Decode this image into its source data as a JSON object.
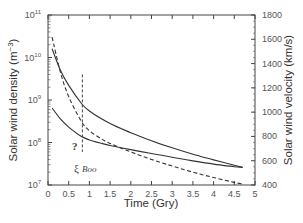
{
  "chart_data": {
    "type": "line",
    "title": "",
    "xlabel": "Time (Gry)",
    "ylabel_left": "Solar wind density (m^-3)",
    "ylabel_right": "Solar wind velocity (km/s)",
    "xlim": [
      0,
      5
    ],
    "ylim_left": [
      10000000.0,
      100000000000.0
    ],
    "ylim_left_scale": "log",
    "ylim_right": [
      400,
      1800
    ],
    "x_ticks": [
      "0",
      "0.5",
      "1",
      "1.5",
      "2",
      "2.5",
      "3",
      "3.5",
      "4",
      "4.5",
      "5"
    ],
    "y_left_ticks": [
      "10^7",
      "10^8",
      "10^9",
      "10^10",
      "10^11"
    ],
    "y_right_ticks": [
      "400",
      "600",
      "800",
      "1000",
      "1200",
      "1400",
      "1600",
      "1800"
    ],
    "grid": false,
    "legend": "none",
    "series": [
      {
        "name": "upper solid curve",
        "style": "solid",
        "axis": "left",
        "x": [
          0.1,
          0.3,
          0.5,
          0.8,
          1.0,
          1.5,
          2.0,
          2.5,
          3.0,
          3.5,
          4.0,
          4.5,
          4.7
        ],
        "values": [
          16000000000.0,
          5000000000.0,
          2200000000.0,
          850000000.0,
          550000000.0,
          280000000.0,
          170000000.0,
          110000000.0,
          75000000.0,
          53000000.0,
          39000000.0,
          29000000.0,
          26000000.0
        ]
      },
      {
        "name": "dashed curve",
        "style": "dashed",
        "axis": "left",
        "x": [
          0.1,
          0.3,
          0.5,
          0.8,
          1.0,
          1.3,
          1.5,
          2.0,
          2.5,
          3.0,
          3.5,
          4.0,
          4.5,
          4.7
        ],
        "values": [
          30000000000.0,
          4500000000.0,
          1200000000.0,
          320000000.0,
          190000000.0,
          120000000.0,
          95000000.0,
          60000000.0,
          40000000.0,
          28000000.0,
          20000000.0,
          15000000.0,
          11500000.0,
          10500000.0
        ]
      },
      {
        "name": "lower solid curve",
        "style": "solid",
        "axis": "left",
        "x": [
          0.1,
          0.3,
          0.5,
          0.8,
          1.0,
          1.3,
          1.5,
          2.0,
          2.5,
          3.0,
          3.5,
          4.0,
          4.5,
          4.7
        ],
        "values": [
          650000000.0,
          360000000.0,
          230000000.0,
          140000000.0,
          115000000.0,
          95000000.0,
          85000000.0,
          68000000.0,
          55000000.0,
          45000000.0,
          37000000.0,
          31000000.0,
          27000000.0,
          26000000.0
        ]
      }
    ],
    "annotations": [
      {
        "text": "?",
        "x": 0.55,
        "y": 120000000.0
      },
      {
        "text": "ξ Boo",
        "x": 0.83,
        "marker": "vertical dashed line",
        "y_range": [
          60000000.0,
          4000000000.0
        ]
      }
    ]
  },
  "labels": {
    "xlabel": "Time (Gry)",
    "ylabel_left": "Solar wind density (m",
    "ylabel_left_sup": "−3",
    "ylabel_left_close": ")",
    "ylabel_right": "Solar wind velocity (km/s)",
    "question": "?",
    "xi_boo_main": "ξ",
    "xi_boo_sub": "",
    "xi_boo_name": "Boo"
  }
}
